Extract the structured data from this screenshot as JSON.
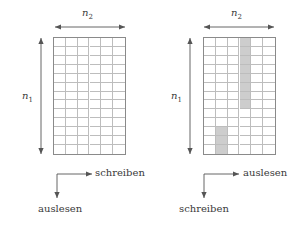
{
  "figure": {
    "style": "matrix-interleaver-diagram",
    "line_color": "#8a8a8a",
    "grid_color": "#bdbdbd",
    "shade_color": "#cdcdcd",
    "text_color": "#3a3a3a"
  },
  "panels": [
    {
      "id": "left",
      "name": "write-row-read-column",
      "grid": {
        "cols": 6,
        "rows": 13,
        "shaded_cells": []
      },
      "dim_horizontal": {
        "label": "n",
        "sub": "2"
      },
      "dim_vertical": {
        "label": "n",
        "sub": "1"
      },
      "flow_horizontal_label": "schreiben",
      "flow_vertical_label": "auslesen"
    },
    {
      "id": "right",
      "name": "read-row-write-column",
      "grid": {
        "cols": 6,
        "rows": 13,
        "shaded_cells": [
          {
            "col": 4,
            "row_start": 1,
            "row_end": 8
          },
          {
            "col": 2,
            "row_start": 11,
            "row_end": 13
          }
        ]
      },
      "dim_horizontal": {
        "label": "n",
        "sub": "2"
      },
      "dim_vertical": {
        "label": "n",
        "sub": "1"
      },
      "flow_horizontal_label": "auslesen",
      "flow_vertical_label": "schreiben"
    }
  ]
}
